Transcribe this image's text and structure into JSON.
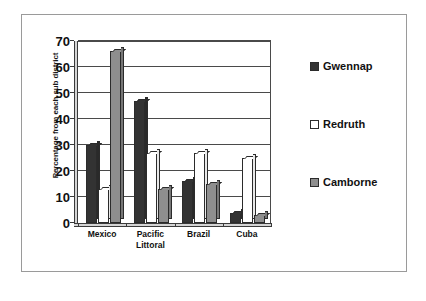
{
  "chart_data": {
    "type": "bar",
    "title": "",
    "subtitle": "",
    "xlabel": "",
    "ylabel": "Percentage from each sub district",
    "ylim": [
      0,
      70
    ],
    "ytick_step": 10,
    "yticks": [
      0,
      10,
      20,
      30,
      40,
      50,
      60,
      70
    ],
    "ytick_labels": [
      "0",
      "10",
      "20",
      "30",
      "40",
      "50",
      "60",
      "70"
    ],
    "grid": "horizontal",
    "legend_position": "right",
    "categories": [
      "Mexico",
      "Pacific Littoral",
      "Brazil",
      "Cuba"
    ],
    "category_lines": [
      [
        "Mexico"
      ],
      [
        "Pacific",
        "Littoral"
      ],
      [
        "Brazil"
      ],
      [
        "Cuba"
      ]
    ],
    "series": [
      {
        "name": "Gwennap",
        "color": "#333333",
        "values": [
          30,
          47,
          16,
          4
        ]
      },
      {
        "name": "Redruth",
        "color": "#ffffff",
        "values": [
          13,
          27,
          27,
          25
        ]
      },
      {
        "name": "Camborne",
        "color": "#8e8e8e",
        "values": [
          66,
          13,
          15,
          3
        ]
      }
    ]
  },
  "legend": {
    "items": [
      {
        "label": "Gwennap",
        "swatch": "legend-swatch-gwennap"
      },
      {
        "label": "Redruth",
        "swatch": "legend-swatch-redruth"
      },
      {
        "label": "Camborne",
        "swatch": "legend-swatch-camborne"
      }
    ]
  }
}
